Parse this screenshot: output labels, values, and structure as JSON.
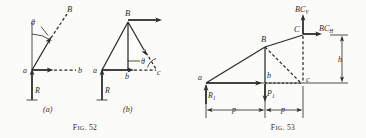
{
  "document": {
    "type": "engineering-figure-plate",
    "background_color": "#fbfbfa",
    "ink_color": "#2b2b2b"
  },
  "figures": [
    {
      "id": "fig-52",
      "caption_prefix": "F",
      "caption_smallcaps": "IG",
      "caption_suffix": ". 52",
      "caption_full": "FIG. 52",
      "panels": [
        {
          "id": "panel-a",
          "label": "(a)",
          "description": "Force vector diagram at joint a with reaction R and member ab, aB",
          "points": [
            {
              "name": "a",
              "label": "a"
            },
            {
              "name": "B",
              "label": "B"
            },
            {
              "name": "b",
              "label": "b"
            }
          ],
          "vectors": [
            {
              "name": "R",
              "label": "R",
              "direction": "up",
              "style": "solid"
            },
            {
              "name": "ab",
              "label": "b",
              "direction": "right",
              "style": "dashed"
            },
            {
              "name": "aB",
              "label": "B",
              "direction": "up-right",
              "style": "solid-then-dashed"
            }
          ],
          "angles": [
            {
              "name": "theta",
              "label": "θ"
            }
          ]
        },
        {
          "id": "panel-b",
          "label": "(b)",
          "description": "Triangle a-B-c force polygon with vertical bB and reaction R",
          "points": [
            {
              "name": "a",
              "label": "a"
            },
            {
              "name": "B",
              "label": "B"
            },
            {
              "name": "b",
              "label": "b"
            },
            {
              "name": "c",
              "label": "c"
            }
          ],
          "vectors": [
            {
              "name": "R",
              "label": "R",
              "direction": "up",
              "style": "solid"
            },
            {
              "name": "bc",
              "label": "c",
              "direction": "right",
              "style": "dashed"
            },
            {
              "name": "B-horizontal",
              "label": "",
              "direction": "right",
              "style": "solid"
            },
            {
              "name": "Bc",
              "label": "",
              "direction": "down-right",
              "style": "solid-then-dashed"
            }
          ],
          "angles": [
            {
              "name": "theta",
              "label": "θ"
            }
          ]
        }
      ]
    },
    {
      "id": "fig-53",
      "caption_prefix": "F",
      "caption_smallcaps": "IG",
      "caption_suffix": ". 53",
      "caption_full": "FIG. 53",
      "description": "Three-hinged arch half with reactions R1, load P1, and hinge components BC_V and BC_H",
      "points": [
        {
          "name": "a",
          "label": "a"
        },
        {
          "name": "B",
          "label": "B"
        },
        {
          "name": "b",
          "label": "b"
        },
        {
          "name": "c",
          "label": "c"
        },
        {
          "name": "C",
          "label": "C"
        }
      ],
      "forces": [
        {
          "name": "R1",
          "base": "R",
          "subscript": "1",
          "direction": "up"
        },
        {
          "name": "P1",
          "base": "P",
          "subscript": "1",
          "direction": "down"
        },
        {
          "name": "BCV",
          "base": "BC",
          "subscript": "V",
          "direction": "up"
        },
        {
          "name": "BCH",
          "base": "BC",
          "subscript": "H",
          "direction": "right"
        }
      ],
      "dimensions": [
        {
          "name": "span-left",
          "label": "p",
          "orientation": "horizontal"
        },
        {
          "name": "span-right",
          "label": "p",
          "orientation": "horizontal"
        },
        {
          "name": "height",
          "label": "h",
          "orientation": "vertical"
        }
      ]
    }
  ]
}
